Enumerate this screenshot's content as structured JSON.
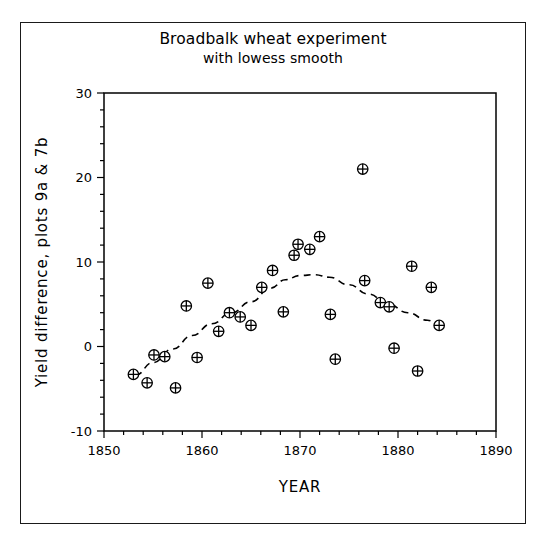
{
  "figure": {
    "title_line1": "Broadbalk wheat experiment",
    "title_line2": "with lowess smooth",
    "background": "#ffffff",
    "frame_color": "#1a1a1a"
  },
  "chart_data": {
    "type": "scatter",
    "title": "Broadbalk wheat experiment with lowess smooth",
    "subtitle": "with lowess smooth",
    "xlabel": "YEAR",
    "ylabel": "Yield difference, plots 9a & 7b",
    "xlim": [
      1850,
      1890
    ],
    "ylim": [
      -10,
      30
    ],
    "xticks": [
      1850,
      1860,
      1870,
      1880,
      1890
    ],
    "xtick_labels": [
      "1850",
      "1860",
      "1870",
      "1880",
      "1890"
    ],
    "xminor_step": 2,
    "yticks": [
      -10,
      0,
      10,
      20,
      30
    ],
    "ytick_labels": [
      "-10",
      "0",
      "10",
      "20",
      "30"
    ],
    "yminor_step": 2,
    "grid": false,
    "legend": null,
    "marker": "circle-plus",
    "marker_color": "#000000",
    "points": [
      {
        "x": 1853.0,
        "y": -3.3
      },
      {
        "x": 1854.4,
        "y": -4.3
      },
      {
        "x": 1855.1,
        "y": -1.0
      },
      {
        "x": 1856.2,
        "y": -1.2
      },
      {
        "x": 1857.3,
        "y": -4.9
      },
      {
        "x": 1858.4,
        "y": 4.8
      },
      {
        "x": 1859.5,
        "y": -1.3
      },
      {
        "x": 1860.6,
        "y": 7.5
      },
      {
        "x": 1861.7,
        "y": 1.8
      },
      {
        "x": 1862.8,
        "y": 4.0
      },
      {
        "x": 1863.9,
        "y": 3.5
      },
      {
        "x": 1865.0,
        "y": 2.5
      },
      {
        "x": 1866.1,
        "y": 7.0
      },
      {
        "x": 1867.2,
        "y": 9.0
      },
      {
        "x": 1868.3,
        "y": 4.1
      },
      {
        "x": 1869.4,
        "y": 10.8
      },
      {
        "x": 1869.8,
        "y": 12.1
      },
      {
        "x": 1871.0,
        "y": 11.5
      },
      {
        "x": 1872.0,
        "y": 13.0
      },
      {
        "x": 1873.1,
        "y": 3.8
      },
      {
        "x": 1873.6,
        "y": -1.5
      },
      {
        "x": 1876.4,
        "y": 21.0
      },
      {
        "x": 1876.6,
        "y": 7.8
      },
      {
        "x": 1878.2,
        "y": 5.2
      },
      {
        "x": 1879.1,
        "y": 4.7
      },
      {
        "x": 1879.6,
        "y": -0.2
      },
      {
        "x": 1881.4,
        "y": 9.5
      },
      {
        "x": 1882.0,
        "y": -2.9
      },
      {
        "x": 1883.4,
        "y": 7.0
      },
      {
        "x": 1884.2,
        "y": 2.5
      }
    ],
    "lowess": {
      "label": "lowess smooth",
      "style": "dashed",
      "color": "#000000",
      "points": [
        {
          "x": 1853.2,
          "y": -3.4
        },
        {
          "x": 1855.0,
          "y": -1.9
        },
        {
          "x": 1857.0,
          "y": -0.3
        },
        {
          "x": 1859.0,
          "y": 1.3
        },
        {
          "x": 1861.0,
          "y": 2.7
        },
        {
          "x": 1863.0,
          "y": 4.0
        },
        {
          "x": 1865.0,
          "y": 5.3
        },
        {
          "x": 1867.0,
          "y": 6.9
        },
        {
          "x": 1868.5,
          "y": 7.9
        },
        {
          "x": 1870.0,
          "y": 8.4
        },
        {
          "x": 1871.5,
          "y": 8.5
        },
        {
          "x": 1873.0,
          "y": 8.2
        },
        {
          "x": 1875.0,
          "y": 7.3
        },
        {
          "x": 1877.0,
          "y": 6.2
        },
        {
          "x": 1879.0,
          "y": 5.0
        },
        {
          "x": 1881.0,
          "y": 4.0
        },
        {
          "x": 1883.0,
          "y": 3.1
        },
        {
          "x": 1884.2,
          "y": 2.6
        }
      ]
    }
  }
}
